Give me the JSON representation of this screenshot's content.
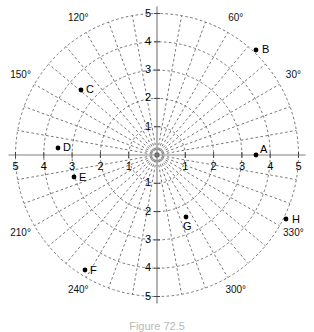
{
  "figure": {
    "type": "polar-grid",
    "caption": "Figure 72.5",
    "center_px": [
      157,
      155
    ],
    "unit_px": 28.3,
    "max_radius": 5,
    "radial_gridlines_deg": 10,
    "circle_gridlines": [
      1,
      2,
      3,
      4,
      5
    ],
    "grid_color": "#555555",
    "axis_color": "#808080",
    "point_color": "#000000"
  },
  "chart_data": {
    "type": "scatter",
    "title": "",
    "xlabel": "",
    "ylabel": "",
    "coordinate_system": "polar",
    "rlim": [
      0,
      5
    ],
    "rticks": [
      1,
      2,
      3,
      4,
      5
    ],
    "thetaticks_deg": [
      0,
      30,
      60,
      90,
      120,
      150,
      180,
      210,
      240,
      270,
      300,
      330
    ],
    "grid": true,
    "legend": "none",
    "angle_labels": [
      {
        "text": "30°",
        "deg": 30
      },
      {
        "text": "60°",
        "deg": 60
      },
      {
        "text": "120°",
        "deg": 120
      },
      {
        "text": "150°",
        "deg": 150
      },
      {
        "text": "210°",
        "deg": 210
      },
      {
        "text": "240°",
        "deg": 240
      },
      {
        "text": "300°",
        "deg": 300
      },
      {
        "text": "330°",
        "deg": 330
      }
    ],
    "axis_tick_labels": {
      "left": [
        "5",
        "4",
        "3",
        "2",
        "1"
      ],
      "right": [
        "1",
        "2",
        "3",
        "4",
        "5"
      ],
      "top": [
        "5",
        "4",
        "3",
        "2",
        "1"
      ],
      "bottom": [
        "1",
        "2",
        "3",
        "4",
        "5"
      ]
    },
    "points": [
      {
        "name": "A",
        "r": 3.5,
        "theta_deg": 0,
        "x_px": 256,
        "y_px": 155,
        "label_dx": 4,
        "label_dy": -10
      },
      {
        "name": "B",
        "r": 4.2,
        "theta_deg": 45,
        "x_px": 256,
        "y_px": 50,
        "label_dx": 6,
        "label_dy": -5
      },
      {
        "name": "C",
        "r": 3.3,
        "theta_deg": 145,
        "x_px": 81,
        "y_px": 90,
        "label_dx": 5,
        "label_dy": -5
      },
      {
        "name": "D",
        "r": 3.5,
        "theta_deg": 181,
        "x_px": 58,
        "y_px": 148,
        "label_dx": 5,
        "label_dy": -5
      },
      {
        "name": "E",
        "r": 3.0,
        "theta_deg": 194,
        "x_px": 74,
        "y_px": 177,
        "label_dx": 5,
        "label_dy": -4
      },
      {
        "name": "F",
        "r": 4.2,
        "theta_deg": 236,
        "x_px": 85,
        "y_px": 270,
        "label_dx": 5,
        "label_dy": -4
      },
      {
        "name": "G",
        "r": 2.2,
        "theta_deg": 287,
        "x_px": 186,
        "y_px": 217,
        "label_dx": -3,
        "label_dy": 5
      },
      {
        "name": "H",
        "r": 4.8,
        "theta_deg": 333,
        "x_px": 286,
        "y_px": 219,
        "label_dx": 6,
        "label_dy": -4
      }
    ]
  }
}
